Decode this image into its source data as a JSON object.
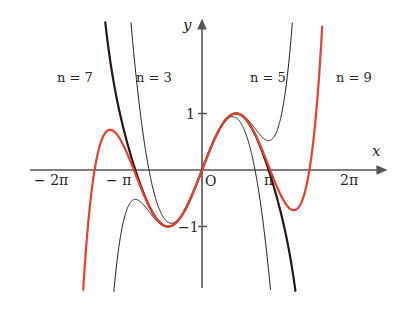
{
  "figure": {
    "background": "#ffffff",
    "width": 402,
    "height": 314,
    "axis_color": "#555555",
    "curve_color": "#1a1a1a",
    "highlight_color": "#e8402c",
    "thick_color": "#2b1412"
  },
  "axes": {
    "x_label": "x",
    "y_label": "y",
    "origin_label": "O",
    "x_ticks": [
      {
        "label": "− 2π",
        "value": -6.2832
      },
      {
        "label": "− π",
        "value": -3.1416
      },
      {
        "label": "π",
        "value": 3.1416
      },
      {
        "label": "2π",
        "value": 6.2832
      }
    ],
    "y_ticks": [
      {
        "label": "1",
        "value": 1
      },
      {
        "label": "−1",
        "value": -1
      }
    ]
  },
  "series_labels": [
    {
      "text": "n = 7",
      "x": 76,
      "y": 78
    },
    {
      "text": "n = 3",
      "x": 155,
      "y": 78
    },
    {
      "text": "n = 5",
      "x": 269,
      "y": 78
    },
    {
      "text": "n = 9",
      "x": 355,
      "y": 78
    }
  ],
  "chart_data": {
    "type": "line",
    "title": "",
    "xlabel": "x",
    "ylabel": "y",
    "xlim": [
      -7.4,
      7.4
    ],
    "ylim": [
      -2.1,
      2.6
    ],
    "grid": false,
    "legend": "inline-labels",
    "xtick_values": [
      -6.2832,
      -3.1416,
      3.1416,
      6.2832
    ],
    "xtick_labels": [
      "− 2π",
      "− π",
      "π",
      "2π"
    ],
    "ytick_values": [
      1,
      -1
    ],
    "ytick_labels": [
      "1",
      "−1"
    ],
    "series": [
      {
        "name": "n = 3",
        "label": "n = 3",
        "kind": "taylor-sin",
        "degree": 3,
        "terms": 2,
        "color": "#1a1a1a",
        "width": 1.0
      },
      {
        "name": "n = 5",
        "label": "n = 5",
        "kind": "taylor-sin",
        "degree": 5,
        "terms": 3,
        "color": "#1a1a1a",
        "width": 1.0
      },
      {
        "name": "n = 7",
        "label": "n = 7",
        "kind": "taylor-sin",
        "degree": 7,
        "terms": 4,
        "color": "#2b1412",
        "width": 2.2
      },
      {
        "name": "n = 9",
        "label": "n = 9",
        "kind": "taylor-sin",
        "degree": 9,
        "terms": 5,
        "color": "#e8402c",
        "width": 2.2
      }
    ]
  }
}
